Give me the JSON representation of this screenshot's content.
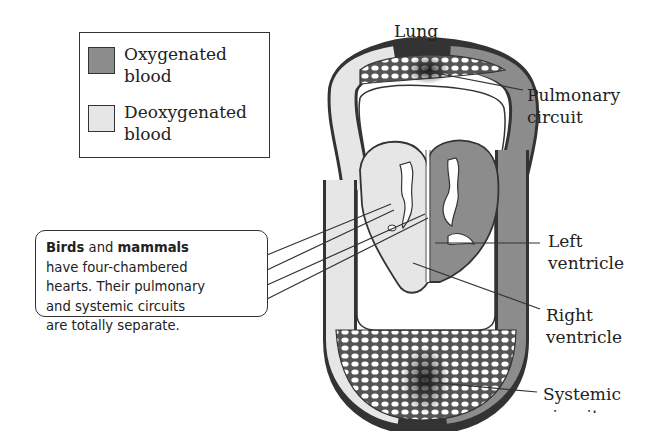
{
  "legend": {
    "items": [
      {
        "label_line1": "Oxygenated",
        "label_line2": "blood",
        "color": "#8c8c8c"
      },
      {
        "label_line1": "Deoxygenated",
        "label_line2": "blood",
        "color": "#e6e6e6"
      }
    ]
  },
  "labels": {
    "lung": "Lung",
    "pulmonary_circuit_line1": "Pulmonary",
    "pulmonary_circuit_line2": "circuit",
    "left_ventricle_line1": "Left",
    "left_ventricle_line2": "ventricle",
    "right_ventricle_line1": "Right",
    "right_ventricle_line2": "ventricle",
    "systemic_circuit_line1": "Systemic",
    "systemic_circuit_line2": "circuit"
  },
  "callout": {
    "bold1": "Birds",
    "text1": " and ",
    "bold2": "mammals",
    "line2": "have four-chambered",
    "line3": "hearts. Their pulmonary",
    "line4": "and systemic circuits",
    "line5": "are totally separate."
  },
  "colors": {
    "oxygenated": "#8c8c8c",
    "deoxygenated": "#e6e6e6",
    "outline": "#333333",
    "capillary_dark": "#2a2a2a"
  }
}
